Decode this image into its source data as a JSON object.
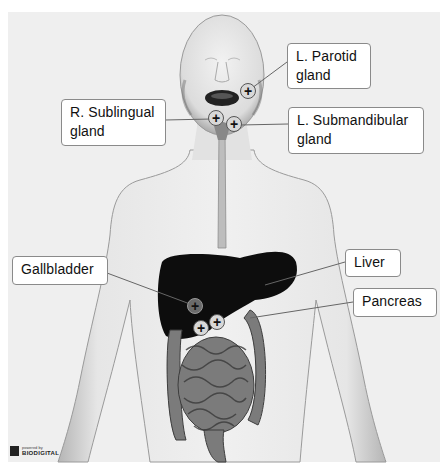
{
  "diagram": {
    "labels": [
      {
        "id": "l-parotid",
        "line1": "L. Parotid",
        "line2": "gland"
      },
      {
        "id": "r-sublingual",
        "line1": "R. Sublingual",
        "line2": "gland"
      },
      {
        "id": "l-submandibular",
        "line1": "L. Submandibular",
        "line2": "gland"
      },
      {
        "id": "gallbladder",
        "line1": "Gallbladder"
      },
      {
        "id": "liver",
        "line1": "Liver"
      },
      {
        "id": "pancreas",
        "line1": "Pancreas"
      }
    ],
    "marker_glyph": "+",
    "colors": {
      "background": "#efefef",
      "body": "#e4e4e4",
      "liver": "#0d0d0d",
      "label_border": "#8a8a8a"
    }
  },
  "branding": {
    "powered_by": "powered by",
    "brand": "BIODIGITAL"
  }
}
